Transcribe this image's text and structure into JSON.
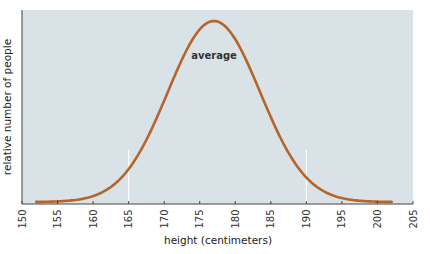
{
  "chart_data": {
    "type": "line",
    "title": "",
    "xlabel": "height (centimeters)",
    "ylabel": "relative number of people",
    "xlim": [
      150,
      205
    ],
    "ylim": [
      0,
      1
    ],
    "x_ticks": [
      150,
      155,
      160,
      165,
      170,
      175,
      180,
      185,
      190,
      195,
      200,
      205
    ],
    "y_ticks": [],
    "grid": false,
    "legend": null,
    "annotations": [
      {
        "text": "average",
        "x": 177,
        "y": 0.8
      }
    ],
    "reference_lines": [
      {
        "x": 165,
        "color": "#ffffff"
      },
      {
        "x": 190,
        "color": "#ffffff"
      }
    ],
    "series": [
      {
        "name": "height distribution",
        "color": "#b5652b",
        "distribution": "normal",
        "mean": 177,
        "sd": 6.5,
        "x": [
          152,
          155,
          158,
          160,
          162,
          165,
          168,
          170,
          172,
          174,
          176,
          177,
          178,
          180,
          182,
          184,
          186,
          188,
          190,
          192,
          194,
          196,
          198,
          200,
          202
        ],
        "y": [
          0.0006,
          0.0033,
          0.014,
          0.033,
          0.069,
          0.182,
          0.383,
          0.56,
          0.744,
          0.899,
          0.988,
          1.0,
          0.988,
          0.899,
          0.744,
          0.56,
          0.383,
          0.237,
          0.135,
          0.069,
          0.033,
          0.014,
          0.0054,
          0.0019,
          0.0006
        ]
      }
    ]
  },
  "colors": {
    "plot_background": "#d9e2e6",
    "curve": "#b5652b",
    "axis": "#444444",
    "reference_line": "#ffffff"
  },
  "labels": {
    "xlabel": "height (centimeters)",
    "ylabel": "relative number of people",
    "annotation": "average"
  }
}
